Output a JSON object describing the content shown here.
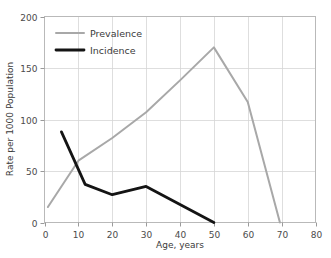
{
  "chart_data": {
    "type": "line",
    "title": "",
    "xlabel": "Age, years",
    "ylabel": "Rate per 1000 Population",
    "xlim": [
      0,
      80
    ],
    "ylim": [
      0,
      200
    ],
    "xticks": [
      "0",
      "10",
      "20",
      "30",
      "40",
      "50",
      "60",
      "70",
      "80"
    ],
    "yticks": [
      "0",
      "50",
      "100",
      "150",
      "200"
    ],
    "xtick_values": [
      0,
      10,
      20,
      30,
      40,
      50,
      60,
      70,
      80
    ],
    "ytick_values": [
      0,
      50,
      100,
      150,
      200
    ],
    "grid": true,
    "legend_position": "upper-left-inside",
    "series": [
      {
        "name": "Prevalence",
        "color": "#a8a8a8",
        "width": 2.0,
        "x": [
          1,
          10,
          20,
          30,
          40,
          50,
          60,
          69.5
        ],
        "values": [
          15,
          60,
          82,
          107,
          138,
          170,
          117,
          0
        ]
      },
      {
        "name": "Incidence",
        "color": "#141414",
        "width": 2.8,
        "x": [
          5,
          12,
          20,
          30,
          50
        ],
        "values": [
          88,
          37,
          27,
          35,
          0
        ]
      }
    ]
  },
  "legend": {
    "entries": [
      {
        "label": "Prevalence"
      },
      {
        "label": "Incidence"
      }
    ]
  },
  "colors": {
    "prevalence": "#a8a8a8",
    "incidence": "#141414",
    "grid": "#d6d6d6",
    "frame": "#b9b9b9",
    "background": "#ffffff"
  }
}
